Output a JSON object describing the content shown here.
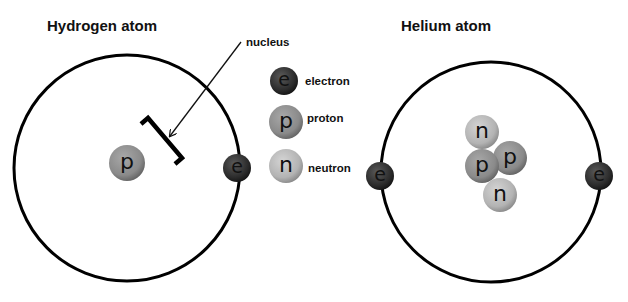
{
  "diagram": {
    "hydrogen": {
      "title": "Hydrogen atom",
      "nucleus": [
        "p"
      ],
      "electrons": [
        "e"
      ],
      "annotation": "nucleus"
    },
    "helium": {
      "title": "Helium atom",
      "nucleus": [
        "n",
        "p",
        "p",
        "n"
      ],
      "electrons": [
        "e",
        "e"
      ]
    },
    "legend": [
      {
        "symbol": "e",
        "label": "electron",
        "color": "#2b2b2b"
      },
      {
        "symbol": "p",
        "label": "proton",
        "color": "#8c8c8c"
      },
      {
        "symbol": "n",
        "label": "neutron",
        "color": "#b5b5b5"
      }
    ],
    "colors": {
      "orbit": "#000000",
      "electron": "#2b2b2b",
      "proton": "#8c8c8c",
      "neutron": "#b5b5b5"
    }
  }
}
